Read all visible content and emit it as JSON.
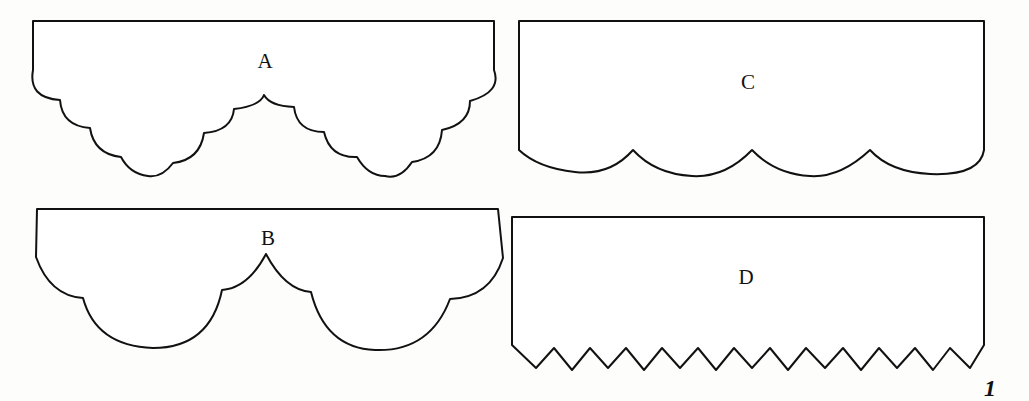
{
  "figure": {
    "page_number": "1",
    "panels": [
      {
        "id": "A",
        "label": "A",
        "edge_style": "double-swag-small-scallops"
      },
      {
        "id": "B",
        "label": "B",
        "edge_style": "double-swag-large-scallops"
      },
      {
        "id": "C",
        "label": "C",
        "edge_style": "four-shallow-scallops"
      },
      {
        "id": "D",
        "label": "D",
        "edge_style": "zigzag"
      }
    ]
  },
  "colors": {
    "stroke": "#111111",
    "fill": "#ffffff",
    "background": "#fdfdfb"
  }
}
